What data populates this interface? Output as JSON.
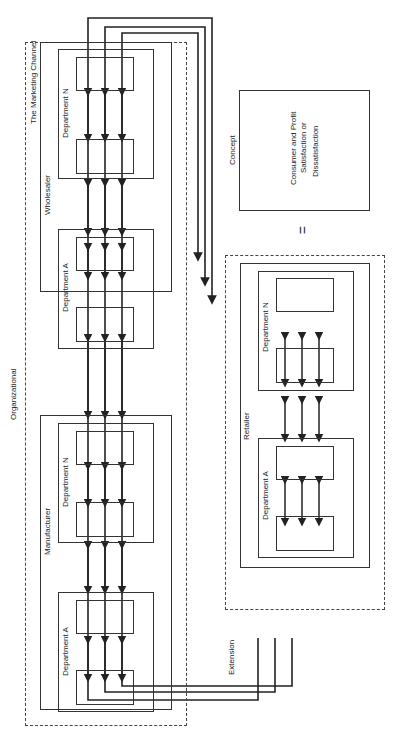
{
  "title": "The Marketing Channel",
  "organizational": "Organizational",
  "extension": "Extension",
  "concept": "Concept",
  "concept_box": [
    "Consumer and Profit",
    "Satisfaction or",
    "Dissatisfaction"
  ],
  "equals": "=",
  "manufacturer": {
    "label": "Manufacturer",
    "dept_a": "Department A",
    "dept_n": "Department N"
  },
  "wholesaler": {
    "label": "Wholesaler",
    "dept_a": "Department A",
    "dept_n": "Department N"
  },
  "retailer": {
    "label": "Retailer",
    "dept_a": "Department A",
    "dept_n": "Department N"
  },
  "person_a": "Person A",
  "person_n": "Person N",
  "rel": {
    "coop": "Coop.",
    "cooperate": "Cooperate",
    "control": "Control",
    "conflict": "Conflict"
  }
}
